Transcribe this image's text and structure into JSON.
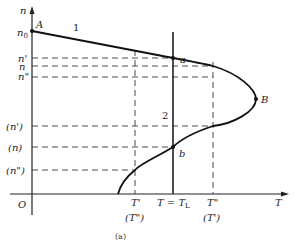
{
  "figure": {
    "caption": "(a)",
    "axes": {
      "x_label": "T",
      "y_label": "n",
      "origin_label": "O"
    },
    "y_ticks_upper": [
      "n0",
      "n'",
      "n",
      "n\""
    ],
    "y_ticks_upper_display": {
      "n0": "n",
      "n0_sub": "0",
      "n1": "n'",
      "n2": "n",
      "n3": "n\""
    },
    "y_ticks_lower": [
      "(n')",
      "(n)",
      "(n\")"
    ],
    "x_ticks": {
      "t1": "T'",
      "t1_alt": "(T\")",
      "tl": "T = T",
      "tl_sub": "L",
      "t2": "T\"",
      "t2_alt": "(T')",
      "t_end": "T"
    },
    "points": {
      "A": "A",
      "B": "B",
      "a": "a",
      "b": "b"
    },
    "curve_labels": {
      "curve1": "1",
      "line2": "2"
    }
  }
}
